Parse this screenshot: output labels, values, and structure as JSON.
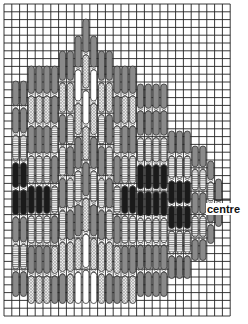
{
  "diagram": {
    "label_centre": "centre",
    "grid": {
      "x0": 4,
      "y0": 4,
      "cell": 7.8,
      "cols": 29,
      "rows": 40,
      "line_color": "#222222"
    },
    "colors": {
      "grey": "#8a8a8a",
      "black": "#1a1a1a",
      "white": "#ffffff",
      "dotted": "#cfcfcf",
      "striped": "#e8e8e8",
      "outline": "#333333"
    },
    "columns": [
      {
        "c": 1,
        "top": 80,
        "bottom": 298,
        "pattern": [
          "grey",
          "grey",
          "striped",
          "black",
          "black",
          "grey",
          "striped",
          "grey"
        ]
      },
      {
        "c": 2,
        "top": 80,
        "bottom": 298,
        "pattern": [
          "grey",
          "grey",
          "striped",
          "black",
          "black",
          "grey",
          "striped",
          "grey"
        ]
      },
      {
        "c": 3,
        "top": 65,
        "bottom": 305,
        "pattern": [
          "grey",
          "dotted",
          "grey",
          "striped",
          "black",
          "striped",
          "grey",
          "dotted"
        ]
      },
      {
        "c": 4,
        "top": 65,
        "bottom": 305,
        "pattern": [
          "grey",
          "dotted",
          "grey",
          "striped",
          "black",
          "striped",
          "grey",
          "dotted"
        ]
      },
      {
        "c": 5,
        "top": 65,
        "bottom": 305,
        "pattern": [
          "grey",
          "dotted",
          "grey",
          "striped",
          "black",
          "striped",
          "grey",
          "dotted"
        ]
      },
      {
        "c": 6,
        "top": 65,
        "bottom": 305,
        "pattern": [
          "grey",
          "grey",
          "striped",
          "grey",
          "striped",
          "grey",
          "dotted",
          "grey"
        ]
      },
      {
        "c": 7,
        "top": 50,
        "bottom": 305,
        "pattern": [
          "grey",
          "dotted",
          "grey",
          "striped",
          "grey",
          "striped",
          "dotted",
          "grey"
        ]
      },
      {
        "c": 8,
        "top": 50,
        "bottom": 305,
        "pattern": [
          "grey",
          "dotted",
          "striped",
          "grey",
          "striped",
          "grey",
          "dotted",
          "dotted"
        ]
      },
      {
        "c": 9,
        "top": 35,
        "bottom": 305,
        "pattern": [
          "grey",
          "white",
          "dotted",
          "grey",
          "striped",
          "grey",
          "dotted",
          "white"
        ]
      },
      {
        "c": 10,
        "top": 18,
        "bottom": 305,
        "pattern": [
          "grey",
          "dotted",
          "white",
          "dotted",
          "grey",
          "dotted",
          "white",
          "white"
        ]
      },
      {
        "c": 11,
        "top": 35,
        "bottom": 305,
        "pattern": [
          "grey",
          "white",
          "dotted",
          "grey",
          "striped",
          "grey",
          "dotted",
          "white"
        ]
      },
      {
        "c": 12,
        "top": 50,
        "bottom": 305,
        "pattern": [
          "grey",
          "dotted",
          "striped",
          "grey",
          "striped",
          "grey",
          "dotted",
          "dotted"
        ]
      },
      {
        "c": 13,
        "top": 50,
        "bottom": 305,
        "pattern": [
          "grey",
          "dotted",
          "grey",
          "striped",
          "grey",
          "striped",
          "dotted",
          "grey"
        ]
      },
      {
        "c": 14,
        "top": 65,
        "bottom": 305,
        "pattern": [
          "grey",
          "grey",
          "striped",
          "grey",
          "striped",
          "grey",
          "dotted",
          "grey"
        ]
      },
      {
        "c": 15,
        "top": 65,
        "bottom": 305,
        "pattern": [
          "grey",
          "dotted",
          "grey",
          "striped",
          "black",
          "striped",
          "grey",
          "dotted"
        ]
      },
      {
        "c": 16,
        "top": 65,
        "bottom": 305,
        "pattern": [
          "grey",
          "dotted",
          "grey",
          "striped",
          "black",
          "striped",
          "grey",
          "dotted"
        ]
      },
      {
        "c": 17,
        "top": 83,
        "bottom": 298,
        "pattern": [
          "grey",
          "grey",
          "striped",
          "black",
          "black",
          "striped",
          "grey",
          "grey"
        ]
      },
      {
        "c": 18,
        "top": 83,
        "bottom": 298,
        "pattern": [
          "grey",
          "grey",
          "striped",
          "black",
          "black",
          "striped",
          "grey",
          "grey"
        ]
      },
      {
        "c": 19,
        "top": 83,
        "bottom": 298,
        "pattern": [
          "grey",
          "grey",
          "striped",
          "black",
          "black",
          "striped",
          "grey",
          "grey"
        ]
      },
      {
        "c": 20,
        "top": 83,
        "bottom": 298,
        "pattern": [
          "grey",
          "grey",
          "striped",
          "black",
          "black",
          "striped",
          "grey",
          "grey"
        ]
      },
      {
        "c": 21,
        "top": 130,
        "bottom": 280,
        "pattern": [
          "grey",
          "striped",
          "black",
          "black",
          "striped",
          "grey"
        ]
      },
      {
        "c": 22,
        "top": 130,
        "bottom": 280,
        "pattern": [
          "grey",
          "striped",
          "black",
          "black",
          "striped",
          "grey"
        ]
      },
      {
        "c": 23,
        "top": 130,
        "bottom": 280,
        "pattern": [
          "grey",
          "striped",
          "black",
          "black",
          "striped",
          "grey"
        ]
      },
      {
        "c": 24,
        "top": 145,
        "bottom": 262,
        "pattern": [
          "grey",
          "striped",
          "grey",
          "striped",
          "grey"
        ]
      },
      {
        "c": 25,
        "top": 145,
        "bottom": 262,
        "pattern": [
          "grey",
          "striped",
          "grey",
          "striped",
          "grey"
        ]
      },
      {
        "c": 26,
        "top": 160,
        "bottom": 245,
        "pattern": [
          "grey",
          "striped",
          "grey",
          "grey"
        ]
      },
      {
        "c": 27,
        "top": 178,
        "bottom": 228,
        "pattern": [
          "grey",
          "grey"
        ]
      }
    ]
  }
}
